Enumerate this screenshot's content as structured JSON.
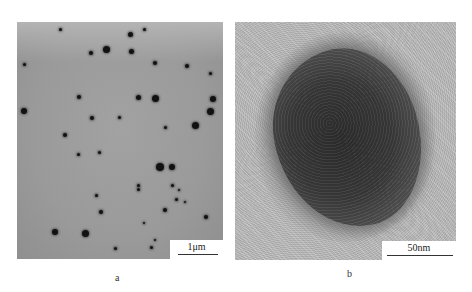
{
  "figure": {
    "panels": [
      {
        "id": "a",
        "caption": "a",
        "scale_label": "1μm",
        "description": "TEM image of dispersed dark nanoparticles on grey background"
      },
      {
        "id": "b",
        "caption": "b",
        "scale_label": "50nm",
        "description": "High-magnification TEM image of a single nanoparticle"
      }
    ]
  },
  "colors": {
    "panel_a_bg": "#9c9c9c",
    "panel_b_bg": "#bdbdbd",
    "particle": "#111111"
  }
}
